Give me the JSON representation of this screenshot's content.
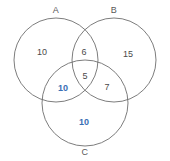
{
  "diagram": {
    "type": "venn",
    "title": "",
    "background_color": "#ffffff",
    "stroke_color": "#6e6e6e",
    "accent_color": "#3a6fb5",
    "dark_text_color": "#4a4a4a",
    "sets": [
      {
        "id": "A",
        "label": "A",
        "label_x": 56,
        "label_y": 10,
        "cx": 56,
        "cy": 60,
        "r": 42
      },
      {
        "id": "B",
        "label": "B",
        "label_x": 114,
        "label_y": 10,
        "cx": 114,
        "cy": 60,
        "r": 42
      },
      {
        "id": "C",
        "label": "C",
        "label_x": 85,
        "label_y": 152,
        "cx": 85,
        "cy": 103,
        "r": 43
      }
    ],
    "regions": [
      {
        "id": "A-only",
        "value": "10",
        "style": "dark",
        "x": 42,
        "y": 52
      },
      {
        "id": "A-and-B",
        "value": "6",
        "style": "dark",
        "x": 84,
        "y": 52
      },
      {
        "id": "B-only",
        "value": "15",
        "style": "dark",
        "x": 128,
        "y": 54
      },
      {
        "id": "A-and-B-and-C",
        "value": "5",
        "style": "dark",
        "x": 85,
        "y": 76
      },
      {
        "id": "A-and-C",
        "value": "10",
        "style": "accent",
        "x": 63,
        "y": 88
      },
      {
        "id": "B-and-C",
        "value": "7",
        "style": "dark",
        "x": 107,
        "y": 87
      },
      {
        "id": "C-only",
        "value": "10",
        "style": "accent",
        "x": 84,
        "y": 122
      }
    ]
  }
}
